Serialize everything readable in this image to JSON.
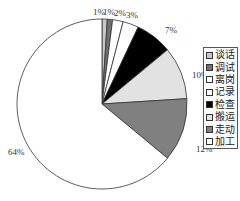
{
  "chart_data": {
    "type": "pie",
    "title": "",
    "categories": [
      "谈话",
      "调试",
      "离岗",
      "记录",
      "检查",
      "搬运",
      "走动",
      "加工"
    ],
    "values": [
      1,
      1,
      2,
      3,
      7,
      10,
      12,
      64
    ],
    "labels": [
      "1%",
      "1%",
      "2%",
      "3%",
      "7%",
      "10%",
      "12%",
      "64%"
    ],
    "colors": [
      "#c8c8c8",
      "#707070",
      "#ffffff",
      "#ffffff",
      "#000000",
      "#e2e2e2",
      "#808080",
      "#ffffff"
    ],
    "start_angle": "top (12 o'clock), clockwise",
    "legend_position": "right"
  },
  "legend": {
    "items": [
      {
        "label": "谈话",
        "color": "#c8c8c8"
      },
      {
        "label": "调试",
        "color": "#707070"
      },
      {
        "label": "离岗",
        "color": "#ffffff"
      },
      {
        "label": "记录",
        "color": "#ffffff"
      },
      {
        "label": "检查",
        "color": "#000000"
      },
      {
        "label": "搬运",
        "color": "#e2e2e2"
      },
      {
        "label": "走动",
        "color": "#808080"
      },
      {
        "label": "加工",
        "color": "#ffffff"
      }
    ]
  }
}
